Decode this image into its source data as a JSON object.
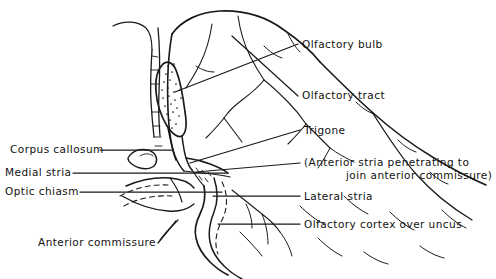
{
  "figure": {
    "width": 496,
    "height": 279,
    "background": "#ffffff",
    "ink_color": "#1a1a1a"
  },
  "labels": {
    "olfactory_bulb": "Olfactory bulb",
    "olfactory_tract": "Olfactory tract",
    "trigone": "Trigone",
    "anterior_stria_line1": "(Anterior stria penetrating to",
    "anterior_stria_line2": "join anterior commissure)",
    "lateral_stria": "Lateral stria",
    "olfactory_cortex": "Olfactory cortex over uncus",
    "corpus_callosum": "Corpus callosum",
    "medial_stria": "Medial stria",
    "optic_chiasm": "Optic chiasm",
    "anterior_commissure": "Anterior commissure"
  },
  "leader_lines": [
    {
      "name": "leader-olfactory-bulb",
      "from": [
        298,
        44
      ],
      "to": [
        175,
        92
      ]
    },
    {
      "name": "leader-olfactory-tract",
      "from": [
        298,
        96
      ],
      "to": [
        232,
        36
      ]
    },
    {
      "name": "leader-trigone",
      "from": [
        300,
        130
      ],
      "to": [
        190,
        163
      ]
    },
    {
      "name": "leader-anterior-stria",
      "from": [
        300,
        163
      ],
      "to": [
        196,
        172
      ]
    },
    {
      "name": "leader-lateral-stria",
      "from": [
        300,
        196
      ],
      "to": [
        213,
        196
      ]
    },
    {
      "name": "leader-olfactory-cortex",
      "from": [
        300,
        224
      ],
      "to": [
        218,
        224
      ]
    },
    {
      "name": "leader-corpus-callosum",
      "from": [
        100,
        150
      ],
      "to": [
        172,
        150
      ]
    },
    {
      "name": "leader-medial-stria",
      "from": [
        73,
        173
      ],
      "to": [
        228,
        173
      ]
    },
    {
      "name": "leader-optic-chiasm",
      "from": [
        80,
        192
      ],
      "to": [
        222,
        192
      ]
    },
    {
      "name": "leader-anterior-commissure",
      "from": [
        158,
        243
      ],
      "to": [
        178,
        219
      ]
    }
  ]
}
